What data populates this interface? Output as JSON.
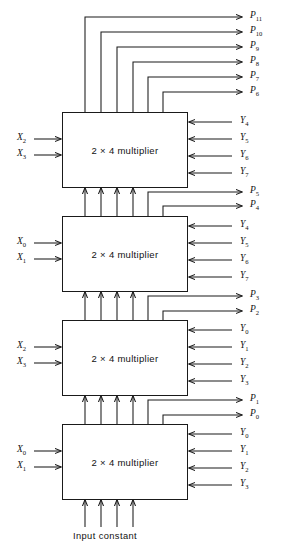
{
  "diagram": {
    "block_label": "2 × 4 multiplier",
    "bottom_label": "Input constant",
    "line_color": "#1a1a1a",
    "background": "#ffffff",
    "blocks": [
      {
        "id": "mult-top",
        "label": "2 × 4 multiplier",
        "x_inputs": [
          {
            "base": "X",
            "sub": "2"
          },
          {
            "base": "X",
            "sub": "3"
          }
        ],
        "y_inputs": [
          {
            "base": "Y",
            "sub": "4"
          },
          {
            "base": "Y",
            "sub": "5"
          },
          {
            "base": "Y",
            "sub": "6"
          },
          {
            "base": "Y",
            "sub": "7"
          }
        ]
      },
      {
        "id": "mult-second",
        "label": "2 × 4 multiplier",
        "x_inputs": [
          {
            "base": "X",
            "sub": "0"
          },
          {
            "base": "X",
            "sub": "1"
          }
        ],
        "y_inputs": [
          {
            "base": "Y",
            "sub": "4"
          },
          {
            "base": "Y",
            "sub": "5"
          },
          {
            "base": "Y",
            "sub": "6"
          },
          {
            "base": "Y",
            "sub": "7"
          }
        ]
      },
      {
        "id": "mult-third",
        "label": "2 × 4 multiplier",
        "x_inputs": [
          {
            "base": "X",
            "sub": "2"
          },
          {
            "base": "X",
            "sub": "3"
          }
        ],
        "y_inputs": [
          {
            "base": "Y",
            "sub": "0"
          },
          {
            "base": "Y",
            "sub": "1"
          },
          {
            "base": "Y",
            "sub": "2"
          },
          {
            "base": "Y",
            "sub": "3"
          }
        ]
      },
      {
        "id": "mult-bottom",
        "label": "2 × 4 multiplier",
        "x_inputs": [
          {
            "base": "X",
            "sub": "0"
          },
          {
            "base": "X",
            "sub": "1"
          }
        ],
        "y_inputs": [
          {
            "base": "Y",
            "sub": "0"
          },
          {
            "base": "Y",
            "sub": "1"
          },
          {
            "base": "Y",
            "sub": "2"
          },
          {
            "base": "Y",
            "sub": "3"
          }
        ]
      }
    ],
    "product_outputs": [
      {
        "base": "P",
        "sub": "11"
      },
      {
        "base": "P",
        "sub": "10"
      },
      {
        "base": "P",
        "sub": "9"
      },
      {
        "base": "P",
        "sub": "8"
      },
      {
        "base": "P",
        "sub": "7"
      },
      {
        "base": "P",
        "sub": "6"
      },
      {
        "base": "P",
        "sub": "5"
      },
      {
        "base": "P",
        "sub": "4"
      },
      {
        "base": "P",
        "sub": "3"
      },
      {
        "base": "P",
        "sub": "2"
      },
      {
        "base": "P",
        "sub": "1"
      },
      {
        "base": "P",
        "sub": "0"
      }
    ]
  }
}
